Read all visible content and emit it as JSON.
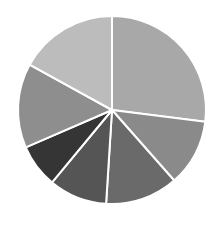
{
  "chart_data": {
    "type": "pie",
    "title": "",
    "legend": [],
    "start_angle_deg": 0,
    "direction": "clockwise",
    "center": [
      112,
      110
    ],
    "radius": 94,
    "labels": [
      "Slice 1",
      "Slice 2",
      "Slice 3",
      "Slice 4",
      "Slice 5",
      "Slice 6",
      "Slice 7"
    ],
    "values": [
      27,
      11.5,
      12.5,
      10,
      7.5,
      14.5,
      17
    ],
    "colors": [
      "#a8a8a8",
      "#8a8a8a",
      "#6a6a6a",
      "#555555",
      "#353535",
      "#8e8e8e",
      "#bcbcbc"
    ],
    "slice_separator_color": "#ffffff",
    "data_labels_visible": false
  }
}
